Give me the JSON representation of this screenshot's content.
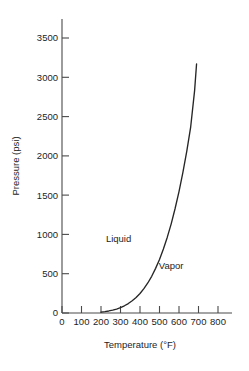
{
  "chart_data": {
    "type": "line",
    "title": "",
    "xlabel": "Temperature (°F)",
    "ylabel": "Pressure (psi)",
    "xlim": [
      0,
      800
    ],
    "ylim": [
      0,
      3500
    ],
    "grid": false,
    "legend_position": "none",
    "x_ticks": [
      "0",
      "100",
      "200",
      "300",
      "400",
      "500",
      "600",
      "700",
      "800"
    ],
    "x_tick_values": [
      0,
      100,
      200,
      300,
      400,
      500,
      600,
      700,
      800
    ],
    "y_ticks": [
      "0",
      "500",
      "1000",
      "1500",
      "2000",
      "2500",
      "3000",
      "3500"
    ],
    "y_tick_values": [
      0,
      500,
      1000,
      1500,
      2000,
      2500,
      3000,
      3500
    ],
    "series": [
      {
        "name": "Saturation (vapor pressure) curve",
        "x": [
          200,
          220,
          240,
          260,
          280,
          300,
          320,
          340,
          360,
          380,
          400,
          420,
          440,
          460,
          480,
          500,
          520,
          540,
          560,
          580,
          600,
          620,
          640,
          660,
          680,
          690
        ],
        "y": [
          12,
          18,
          26,
          36,
          50,
          68,
          92,
          120,
          155,
          198,
          248,
          310,
          382,
          467,
          568,
          682,
          815,
          965,
          1135,
          1330,
          1545,
          1790,
          2060,
          2370,
          2830,
          3170
        ]
      }
    ],
    "annotations": [
      {
        "text": "Liquid",
        "x": 290,
        "y": 900
      },
      {
        "text": "Vapor",
        "x": 560,
        "y": 560
      }
    ]
  },
  "axis_titles": {
    "x": "Temperature (°F)",
    "y": "Pressure (psi)"
  },
  "region_labels": {
    "liquid": "Liquid",
    "vapor": "Vapor"
  },
  "colors": {
    "curve": "#262626",
    "axis": "#4a4a4a",
    "text": "#1d1d1d",
    "background": "#ffffff"
  }
}
